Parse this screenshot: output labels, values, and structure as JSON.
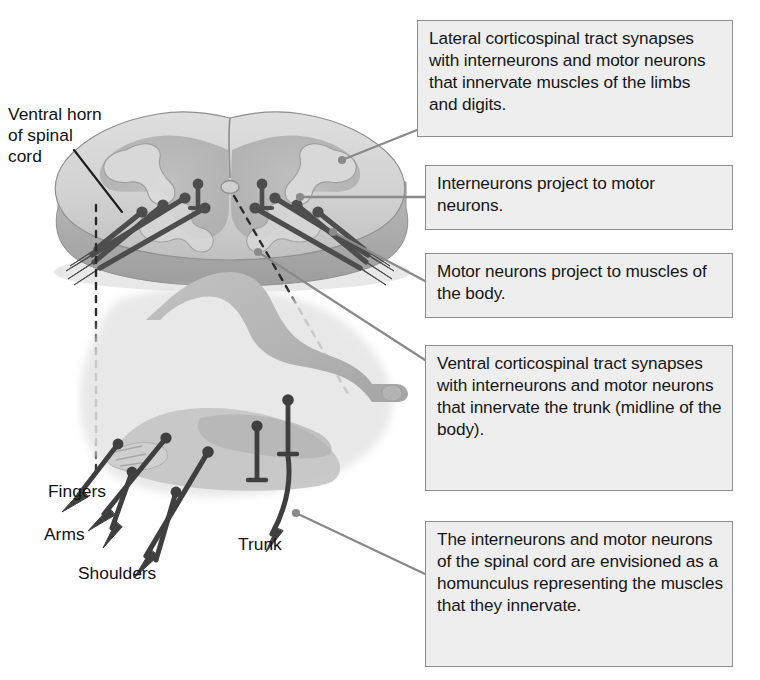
{
  "figure": {
    "width": 760,
    "height": 680,
    "background": "#ffffff"
  },
  "colors": {
    "box_fill": "#eeeeee",
    "box_border": "#8d8d8d",
    "text": "#161616",
    "leader_line": "#8a8a8a",
    "neuron": "#4a4a4a",
    "cord_light": "#d9d9d9",
    "cord_mid": "#c4c4c4",
    "cord_dark": "#a8a8a8",
    "gray_matter": "#b4b4b4",
    "homunculus": "#b8b8b8",
    "homunculus_dark": "#a0a0a0"
  },
  "callouts": [
    {
      "id": "callout-1",
      "text": "Lateral corticospinal tract synapses with interneurons and motor neurons that innervate muscles of the limbs and digits."
    },
    {
      "id": "callout-2",
      "text": "Interneurons project to motor neurons."
    },
    {
      "id": "callout-3",
      "text": "Motor neurons project to muscles of the body."
    },
    {
      "id": "callout-4",
      "text": "Ventral corticospinal tract synapses with interneurons and motor neurons that innervate the trunk (midline of the body)."
    },
    {
      "id": "callout-5",
      "text": "The interneurons and motor neurons of the spinal cord are envisioned as a homunculus representing the muscles that they innervate."
    }
  ],
  "labels": {
    "ventral_horn": "Ventral horn\nof spinal\ncord",
    "fingers": "Fingers",
    "arms": "Arms",
    "shoulders": "Shoulders",
    "trunk": "Trunk"
  },
  "anatomy": {
    "spinal_cord_section": "spinal-cord-cross-section",
    "homunculus": "reclining-human-figure",
    "neuron_count_left": 5,
    "neuron_count_right": 5,
    "homunculus_neuron_count": 6
  }
}
